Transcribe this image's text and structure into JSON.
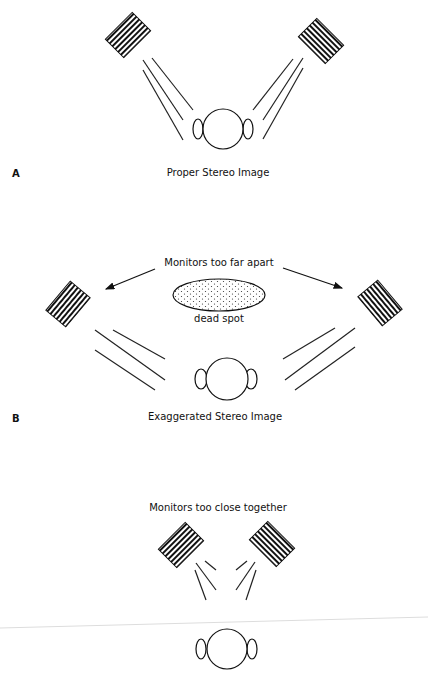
{
  "panels": [
    {
      "letter": "A",
      "caption": "Proper Stereo Image"
    },
    {
      "letter": "B",
      "caption": "Exaggerated Stereo Image",
      "annotation": "Monitors too far apart",
      "dead_spot_label": "dead spot"
    },
    {
      "letter": "",
      "annotation": "Monitors too close together"
    }
  ],
  "colors": {
    "ink": "#111111",
    "background": "#ffffff",
    "divider": "#dddddd"
  }
}
